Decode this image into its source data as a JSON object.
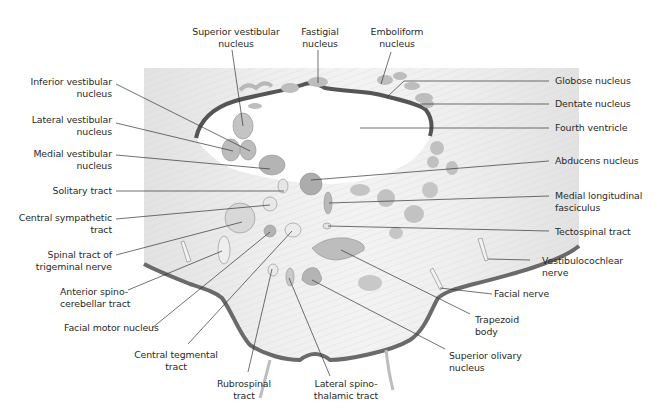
{
  "figure": {
    "colors": {
      "background": "#ffffff",
      "tissue": "#e4e4e4",
      "tissue_light": "#f0f0f0",
      "nucleus": "#b9b9b9",
      "nucleus_dark": "#a6a6a6",
      "ventricle_border": "#555555",
      "leader_line": "#333333",
      "label_text": "#2a2a2a"
    }
  },
  "labels": {
    "superior_vestibular": "Superior vestibular\nnucleus",
    "fastigial": "Fastigial\nnucleus",
    "emboliform": "Emboliform\nnucleus",
    "inferior_vestibular": "Inferior vestibular\nnucleus",
    "lateral_vestibular": "Lateral vestibular\nnucleus",
    "medial_vestibular": "Medial vestibular\nnucleus",
    "solitary_tract": "Solitary tract",
    "central_sympathetic": "Central sympathetic\ntract",
    "spinal_trigeminal": "Spinal tract of\ntrigeminal nerve",
    "anterior_spinocerebellar": "Anterior spino-\ncerebellar tract",
    "facial_motor": "Facial motor nucleus",
    "central_tegmental": "Central tegmental\ntract",
    "rubrospinal": "Rubrospinal\ntract",
    "lateral_spinothalamic": "Lateral spino-\nthalamic tract",
    "superior_olivary": "Superior olivary\nnucleus",
    "trapezoid_body": "Trapezoid\nbody",
    "facial_nerve": "Facial nerve",
    "vestibulocochlear": "Vestibulocochlear\nnerve",
    "tectospinal": "Tectospinal tract",
    "medial_longitudinal": "Medial longitudinal\nfasciculus",
    "abducens": "Abducens nucleus",
    "fourth_ventricle": "Fourth ventricle",
    "dentate": "Dentate nucleus",
    "globose": "Globose nucleus"
  }
}
